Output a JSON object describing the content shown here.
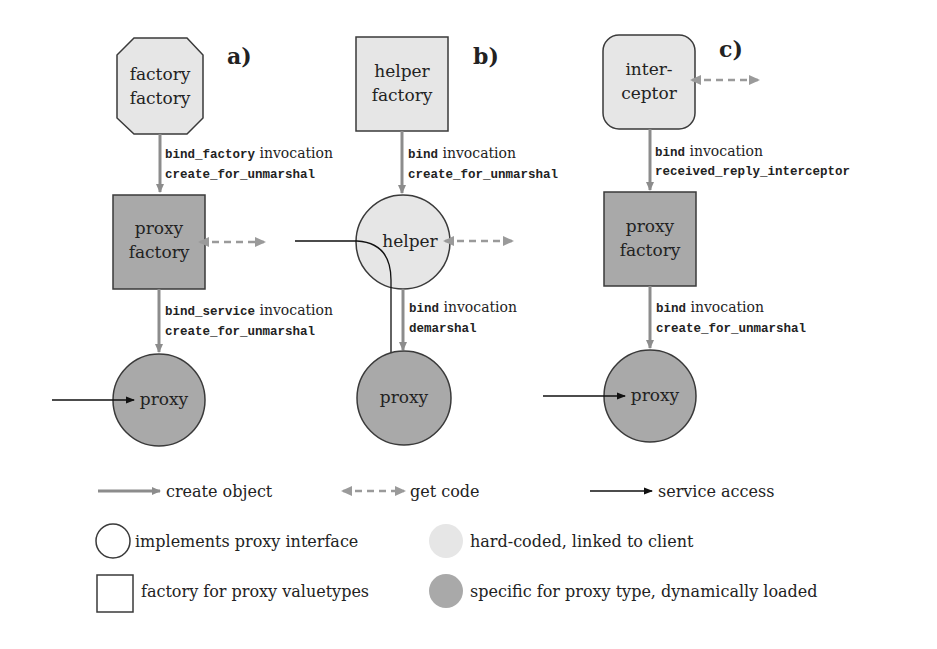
{
  "colors": {
    "light_fill": "#e6e6e6",
    "dark_fill": "#a9a9a9",
    "outline": "#3a3a3a",
    "create_arrow": "#8c8c8c",
    "get_code_arrow": "#9a9a9a",
    "service_arrow": "#111111"
  },
  "panels": {
    "a": {
      "label": "a)",
      "top_node": {
        "line1": "factory",
        "line2": "factory",
        "shape": "octagon",
        "fill": "light"
      },
      "edge1": {
        "mono1": "bind_factory",
        "serif1": " invocation",
        "mono2": "create_for_unmarshal"
      },
      "mid_node": {
        "line1": "proxy",
        "line2": "factory",
        "shape": "square",
        "fill": "dark"
      },
      "edge2": {
        "mono1": "bind_service",
        "serif1": " invocation",
        "mono2": "create_for_unmarshal"
      },
      "bottom_node": {
        "line1": "proxy",
        "shape": "circle",
        "fill": "dark"
      }
    },
    "b": {
      "label": "b)",
      "top_node": {
        "line1": "helper",
        "line2": "factory",
        "shape": "square",
        "fill": "light"
      },
      "edge1": {
        "mono1": "bind",
        "serif1": " invocation",
        "mono2": "create_for_unmarshal"
      },
      "mid_node": {
        "line1": "helper",
        "shape": "circle",
        "fill": "light"
      },
      "edge2": {
        "mono1": "bind",
        "serif1": " invocation",
        "mono2": "demarshal"
      },
      "bottom_node": {
        "line1": "proxy",
        "shape": "circle",
        "fill": "dark"
      }
    },
    "c": {
      "label": "c)",
      "top_node": {
        "line1": "inter-",
        "line2": "ceptor",
        "shape": "rounded-square",
        "fill": "light"
      },
      "edge1": {
        "mono1": "bind",
        "serif1": " invocation",
        "mono2": "received_reply_interceptor"
      },
      "mid_node": {
        "line1": "proxy",
        "line2": "factory",
        "shape": "square",
        "fill": "dark"
      },
      "edge2": {
        "mono1": "bind",
        "serif1": " invocation",
        "mono2": "create_for_unmarshal"
      },
      "bottom_node": {
        "line1": "proxy",
        "shape": "circle",
        "fill": "dark"
      }
    }
  },
  "legend": {
    "arrows": [
      {
        "icon": "create-object-arrow",
        "label": "create object"
      },
      {
        "icon": "get-code-arrow",
        "label": "get code"
      },
      {
        "icon": "service-access-arrow",
        "label": "service access"
      }
    ],
    "shapes": [
      {
        "icon": "circle-outline",
        "label": "implements proxy interface"
      },
      {
        "icon": "square-outline",
        "label": "factory for proxy valuetypes"
      }
    ],
    "fills": [
      {
        "icon": "light-filled-circle",
        "label": "hard-coded, linked to client"
      },
      {
        "icon": "dark-filled-circle",
        "label": "specific for proxy type, dynamically loaded"
      }
    ]
  }
}
